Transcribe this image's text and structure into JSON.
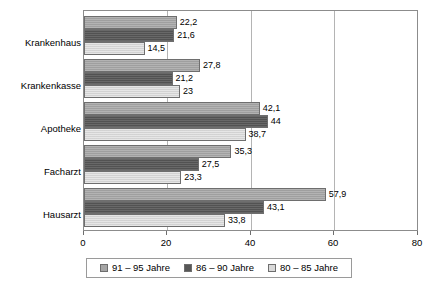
{
  "chart_data": {
    "type": "bar",
    "orientation": "horizontal",
    "title": "",
    "xlabel": "",
    "ylabel": "",
    "xlim": [
      0,
      80
    ],
    "xticks": [
      0,
      20,
      40,
      60,
      80
    ],
    "xtick_labels": [
      "0",
      "20",
      "40",
      "60",
      "80"
    ],
    "grid": true,
    "legend_position": "bottom",
    "categories": [
      "Krankenhaus",
      "Krankenkasse",
      "Apotheke",
      "Facharzt",
      "Hausarzt"
    ],
    "series": [
      {
        "name": "91 – 95 Jahre",
        "color": "#a5a5a5",
        "values": [
          22.2,
          27.8,
          42.1,
          35.3,
          57.9
        ],
        "labels": [
          "22,2",
          "27,8",
          "42,1",
          "35,3",
          "57,9"
        ]
      },
      {
        "name": "86 – 90 Jahre",
        "color": "#575757",
        "values": [
          21.6,
          21.2,
          44,
          27.5,
          43.1
        ],
        "labels": [
          "21,6",
          "21,2",
          "44",
          "27,5",
          "43,1"
        ]
      },
      {
        "name": "80 – 85 Jahre",
        "color": "#d9d9d9",
        "values": [
          14.5,
          23,
          38.7,
          23.3,
          33.8
        ],
        "labels": [
          "14,5",
          "23",
          "38,7",
          "23,3",
          "33,8"
        ]
      }
    ]
  }
}
